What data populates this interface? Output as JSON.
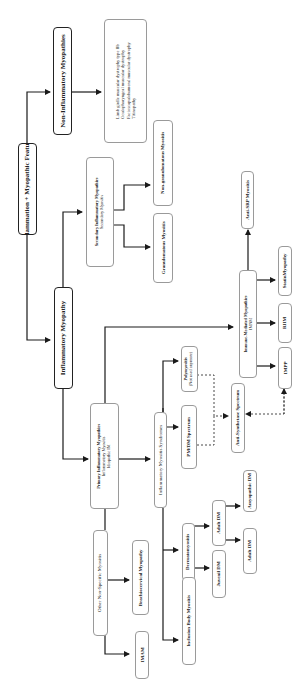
{
  "diagram": {
    "orientation": "rotated-90-ccw",
    "root": {
      "label": "Inflammation + Myopathic Features"
    },
    "non_inflammatory": {
      "label": "Non-Inflammatory Myopathies",
      "examples": [
        "Limb girdle muscular dystrophy type IIb",
        "Oculopharyngeal muscular dystrophy",
        "Facioscapulohumeral muscular dystrophy",
        "Titinopathy"
      ]
    },
    "inflammatory": {
      "label": "Inflammatory Myopathy",
      "secondary": {
        "line1": "Secondary Inflammatory Myopathies",
        "line2": "Secondary Myositis",
        "children": [
          "Granulomatous Myositis",
          "Non-granulomatous Myositis"
        ]
      },
      "primary": {
        "line1": "Primary Inflammatory Myopathies",
        "line2": "Inflammatory Myositis",
        "line3": "Idiopathic IM"
      },
      "other_nonspecific": {
        "label": "Other Non-Specific Myositis",
        "children": [
          "Brachiocervical Myopathy",
          "IMAM"
        ]
      },
      "ims": {
        "label": "Inflammatory Myositis Syndromes",
        "pm_dm": "PM/DM Spectrum",
        "polymyositis": {
          "line1": "Polymyositis",
          "line2": "(Not used anymore)"
        },
        "anti_synthetase": "Anti-Synthetase Spectrum",
        "dermatomyositis": "Dermatomyositis",
        "juvenile_dm": "Juvenil DM",
        "adult_dm_parent": "Adult DM",
        "adult_dm": "Adult DM",
        "amyopathic_dm": "Amyopathic DM",
        "inclusion_body": "Inclusion Body Myositis"
      },
      "imnm": {
        "line1": "Immune-Mediated Myopathies",
        "line2": "IMNM",
        "children": [
          "Anti-SRP Myositis",
          "StatinMyopathy",
          "RIIM",
          "IMPP"
        ]
      }
    }
  },
  "colors": {
    "line": "#1a1a1a",
    "border_light": "#9a9a9a",
    "text": "#222222"
  }
}
